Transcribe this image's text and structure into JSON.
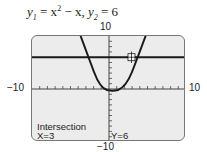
{
  "equation": {
    "y1_lhs": "y",
    "y1_sub": "1",
    "y1_rhs_a": " = x",
    "y1_sup": "2",
    "y1_rhs_b": " − x,  ",
    "y2_lhs": "y",
    "y2_sub": "2",
    "y2_rhs": " = 6"
  },
  "window": {
    "ymax_label": "10",
    "ymin_label": "−10",
    "xmin_label": "−10",
    "xmax_label": "10",
    "xmin": -10,
    "xmax": 10,
    "ymin": -10,
    "ymax": 10
  },
  "screen": {
    "background": "#ececec",
    "intersection_label": "Intersection",
    "x_readout": "X=3",
    "y_readout": "Y=6"
  },
  "graph": {
    "curve1": "y = x^2 - x",
    "curve2": "y = 6",
    "intersection": {
      "x": 3,
      "y": 6
    }
  }
}
